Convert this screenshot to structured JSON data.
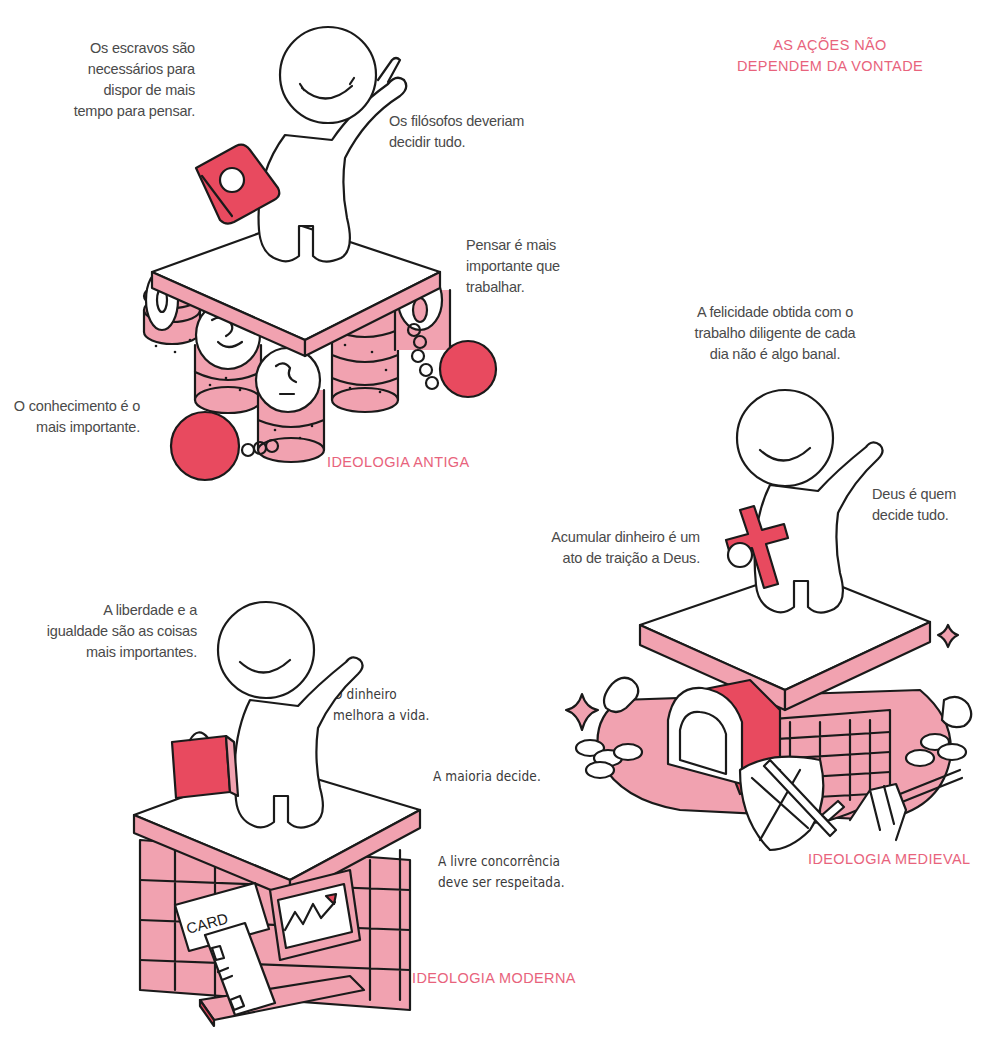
{
  "page": {
    "headline": "AS AÇÕES NÃO\nDEPENDEM DA VONTADE",
    "colors": {
      "accent_label": "#e8637c",
      "pink_fill": "#f1a2b0",
      "red_fill": "#e84a5f",
      "ink": "#1a1a1a",
      "text": "#4a4a4a"
    }
  },
  "sections": {
    "antiga": {
      "label": "IDEOLOGIA ANTIGA",
      "quotes": [
        "Os escravos são\nnecessários para\ndispor de mais\ntempo para pensar.",
        "Os filósofos deveriam\ndecidir tudo.",
        "Pensar é mais\nimportante que\ntrabalhar.",
        "O conhecimento é o\nmais importante."
      ],
      "props": [
        "book-icon",
        "coin-stack-icon",
        "ball-and-chain-icon"
      ]
    },
    "medieval": {
      "label": "IDEOLOGIA MEDIEVAL",
      "quotes": [
        "A felicidade obtida com o\ntrabalho diligente de cada\ndia não é algo banal.",
        "Acumular dinheiro é um\nato de traição a Deus.",
        "Deus é quem\ndecide tudo."
      ],
      "props": [
        "cross-icon",
        "treasure-chest-icon",
        "shield-icon",
        "sword-icon",
        "pitchfork-icon",
        "sparkle-icon"
      ]
    },
    "moderna": {
      "label": "IDEOLOGIA MODERNA",
      "quotes": [
        "A liberdade e a\nigualdade são as coisas\nmais importantes.",
        "O dinheiro\nmelhora a vida.",
        "A maioria decide.",
        "A livre concorrência\ndeve ser respeitada."
      ],
      "card_text": "CARD",
      "props": [
        "briefcase-icon",
        "credit-card-icon",
        "laptop-chart-icon"
      ]
    }
  }
}
